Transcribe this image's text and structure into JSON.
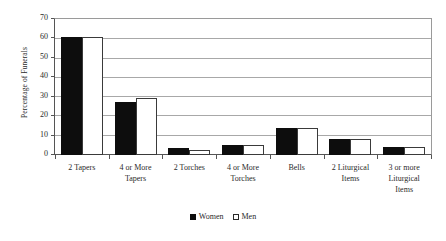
{
  "chart_data": {
    "type": "bar",
    "title": "",
    "xlabel": "",
    "ylabel": "Percentage of Funerals",
    "ylim": [
      0,
      70
    ],
    "yticks": [
      0,
      10,
      20,
      30,
      40,
      50,
      60,
      70
    ],
    "grid": true,
    "legend_position": "bottom-center",
    "categories": [
      "2 Tapers",
      "4 or More Tapers",
      "2 Torches",
      "4 or More Torches",
      "Bells",
      "2 Liturgical Items",
      "3 or more Liturgical Items"
    ],
    "category_lines": [
      [
        "2 Tapers"
      ],
      [
        "4 or More",
        "Tapers"
      ],
      [
        "2 Torches"
      ],
      [
        "4 or More",
        "Torches"
      ],
      [
        "Bells"
      ],
      [
        "2 Liturgical",
        "Items"
      ],
      [
        "3 or more",
        "Liturgical",
        "Items"
      ]
    ],
    "series": [
      {
        "name": "Women",
        "color": "#0d0d0d",
        "values": [
          61,
          27.5,
          3.5,
          5,
          14,
          8,
          4
        ]
      },
      {
        "name": "Men",
        "color": "#ffffff",
        "values": [
          61,
          29.5,
          2.7,
          5,
          14,
          8.2,
          4
        ]
      }
    ]
  },
  "legend": {
    "entries": [
      {
        "label": "Women",
        "swatch": "filled-square-icon"
      },
      {
        "label": "Men",
        "swatch": "empty-square-icon"
      }
    ]
  }
}
